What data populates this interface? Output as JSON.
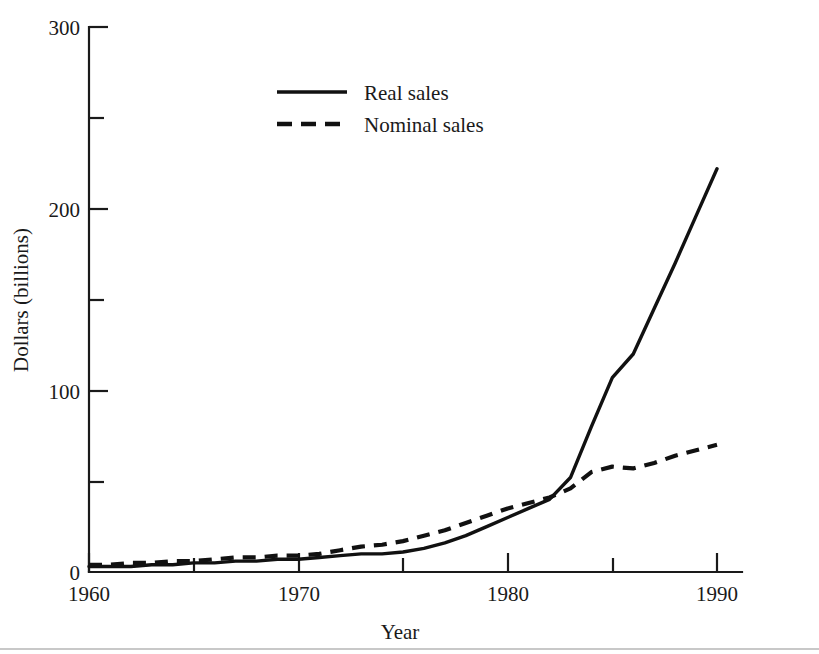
{
  "chart_data": {
    "type": "line",
    "title": "",
    "xlabel": "Year",
    "ylabel": "Dollars (billions)",
    "xlim": [
      1960,
      1991
    ],
    "ylim": [
      0,
      300
    ],
    "grid": false,
    "legend_position": "upper-center-left",
    "x_major_ticks": [
      1960,
      1970,
      1980,
      1990
    ],
    "x_major_tick_labels": [
      "1960",
      "1970",
      "1980",
      "1990"
    ],
    "x_minor_ticks": [
      1965,
      1975,
      1985
    ],
    "y_major_ticks": [
      0,
      100,
      200,
      300
    ],
    "y_major_tick_labels": [
      "0",
      "100",
      "200",
      "300"
    ],
    "y_minor_ticks": [
      50,
      150,
      250
    ],
    "x": [
      1960,
      1961,
      1962,
      1963,
      1964,
      1965,
      1966,
      1967,
      1968,
      1969,
      1970,
      1971,
      1972,
      1973,
      1974,
      1975,
      1976,
      1977,
      1978,
      1979,
      1980,
      1981,
      1982,
      1983,
      1984,
      1985,
      1986,
      1987,
      1988,
      1989,
      1990
    ],
    "series": [
      {
        "name": "Real sales",
        "style": "solid",
        "color": "#111111",
        "values": [
          3,
          3,
          3,
          4,
          4,
          5,
          5,
          6,
          6,
          7,
          7,
          8,
          9,
          10,
          10,
          11,
          13,
          16,
          20,
          25,
          30,
          35,
          40,
          52,
          80,
          107,
          120,
          145,
          170,
          196,
          222
        ]
      },
      {
        "name": "Nominal sales",
        "style": "dashed",
        "color": "#111111",
        "values": [
          4,
          4,
          5,
          5,
          6,
          6,
          7,
          8,
          8,
          9,
          9,
          10,
          12,
          14,
          15,
          17,
          20,
          23,
          27,
          31,
          35,
          38,
          41,
          46,
          55,
          58,
          57,
          60,
          64,
          67,
          70
        ]
      }
    ]
  },
  "axes": {
    "y_label": "Dollars (billions)",
    "x_label": "Year",
    "y_tick_labels": [
      "300",
      "200",
      "100",
      "0"
    ],
    "x_tick_labels": [
      "1960",
      "1970",
      "1980",
      "1990"
    ]
  },
  "legend": {
    "entries": [
      {
        "label": "Real sales",
        "style": "solid"
      },
      {
        "label": "Nominal sales",
        "style": "dashed"
      }
    ]
  }
}
